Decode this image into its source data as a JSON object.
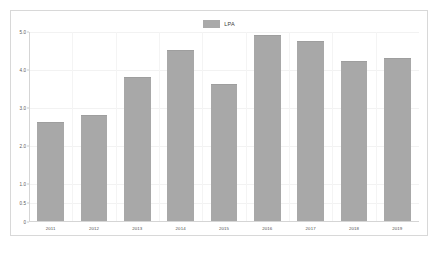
{
  "chart_data": {
    "type": "bar",
    "title": "",
    "xlabel": "",
    "ylabel": "",
    "categories": [
      "2011",
      "2012",
      "2013",
      "2014",
      "2015",
      "2016",
      "2017",
      "2018",
      "2019"
    ],
    "values": [
      2.6,
      2.8,
      3.8,
      4.5,
      3.6,
      4.9,
      4.75,
      4.2,
      4.3
    ],
    "series": [
      {
        "name": "LPA",
        "values": [
          2.6,
          2.8,
          3.8,
          4.5,
          3.6,
          4.9,
          4.75,
          4.2,
          4.3
        ],
        "color": "#a8a8a8"
      }
    ],
    "ylim": [
      0,
      5.0
    ],
    "yticks": [
      0,
      0.5,
      1.0,
      2.0,
      3.0,
      4.0,
      5.0
    ],
    "ytick_labels": [
      "0",
      "0.5",
      "1.0",
      "2.0",
      "3.0",
      "4.0",
      "5.0"
    ],
    "grid": true,
    "legend": {
      "position": "top-center",
      "entries": [
        {
          "label": "LPA",
          "color": "#a8a8a8"
        }
      ]
    }
  },
  "legend": {
    "entries": [
      {
        "label": "LPA"
      }
    ]
  },
  "axes": {
    "y_ticks": [
      {
        "label": "5.0",
        "value": 5.0
      },
      {
        "label": "4.0",
        "value": 4.0
      },
      {
        "label": "3.0",
        "value": 3.0
      },
      {
        "label": "2.0",
        "value": 2.0
      },
      {
        "label": "1.0",
        "value": 1.0
      },
      {
        "label": "0.5",
        "value": 0.5
      },
      {
        "label": "0",
        "value": 0
      }
    ],
    "x_ticks": [
      {
        "label": "2011"
      },
      {
        "label": "2012"
      },
      {
        "label": "2013"
      },
      {
        "label": "2014"
      },
      {
        "label": "2015"
      },
      {
        "label": "2016"
      },
      {
        "label": "2017"
      },
      {
        "label": "2018"
      },
      {
        "label": "2019"
      }
    ]
  },
  "colors": {
    "bar": "#a8a8a8",
    "grid": "#f2f2f2",
    "axis": "#d5d5d5",
    "frame": "#d8d8d8",
    "background": "#ffffff",
    "tick_text": "#5a5a5a"
  }
}
